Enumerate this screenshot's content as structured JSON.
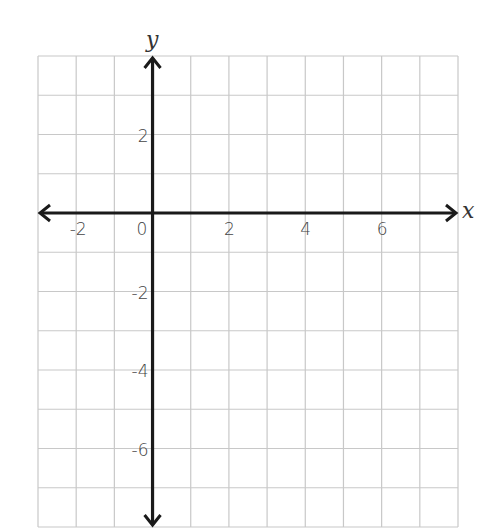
{
  "chart_data": {
    "type": "scatter",
    "title": "",
    "xlabel": "x",
    "ylabel": "y",
    "xlim": [
      -3,
      8
    ],
    "ylim": [
      -8,
      4
    ],
    "grid": true,
    "grid_step": 1,
    "x_ticks": [
      -2,
      0,
      2,
      4,
      6
    ],
    "y_ticks": [
      2,
      -2,
      -4,
      -6
    ],
    "x_tick_labels": [
      "-2",
      "0",
      "2",
      "4",
      "6"
    ],
    "y_tick_labels": [
      "2",
      "-2",
      "-4",
      "-6"
    ],
    "series": [],
    "legend": null,
    "arrows": {
      "x_positive": true,
      "x_negative": true,
      "y_positive": true,
      "y_negative": true
    }
  },
  "colors": {
    "grid": "#c8c8c8",
    "axis": "#1a1a1a",
    "text": "#444444",
    "background": "#ffffff"
  },
  "labels": {
    "x_axis": "x",
    "y_axis": "y",
    "origin": "0"
  }
}
